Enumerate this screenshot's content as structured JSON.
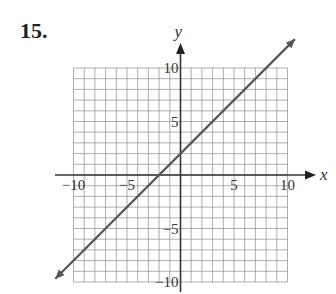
{
  "problem": {
    "number": "15."
  },
  "chart_data": {
    "type": "line",
    "title": "",
    "xlabel": "x",
    "ylabel": "y",
    "xlim": [
      -10,
      10
    ],
    "ylim": [
      -10,
      10
    ],
    "grid": true,
    "grid_step": 1,
    "x_ticks": [
      -10,
      -5,
      5,
      10
    ],
    "y_ticks": [
      10,
      5,
      -5,
      -10
    ],
    "x_tick_labels": [
      "−10",
      "−5",
      "5",
      "10"
    ],
    "y_tick_labels": [
      "10",
      "5",
      "−5",
      "−10"
    ],
    "series": [
      {
        "name": "line",
        "equation": "y = x + 2",
        "slope": 1,
        "intercept": 2,
        "x": [
          -11.7,
          10.7
        ],
        "y": [
          -9.7,
          12.7
        ],
        "arrows": "both"
      }
    ],
    "key_points": [
      {
        "x": -2,
        "y": 0
      },
      {
        "x": 0,
        "y": 2
      }
    ]
  },
  "colors": {
    "grid": "#9a9a9a",
    "axis": "#333333",
    "line": "#555555"
  }
}
